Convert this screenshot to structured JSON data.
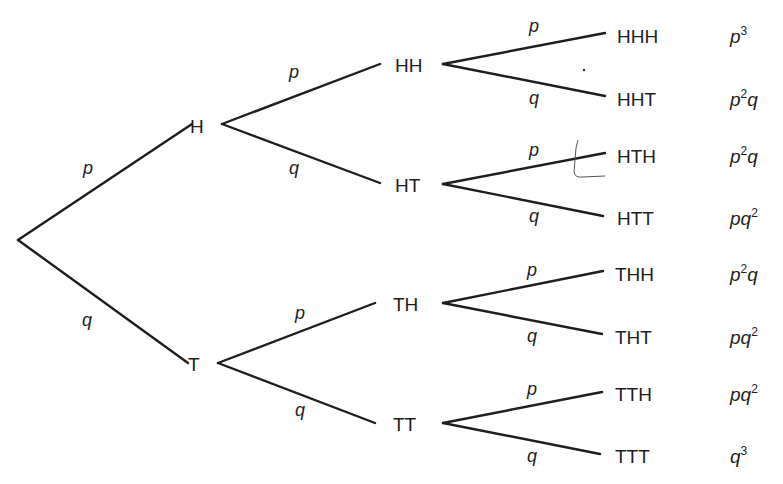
{
  "diagram": {
    "type": "probability-tree",
    "root": {
      "x": 18,
      "y": 240
    },
    "level1": [
      {
        "id": "H",
        "label": "H",
        "x": 190,
        "y": 126,
        "branch_start": [
          222,
          124
        ],
        "edge_label": "p",
        "edge_label_pos": [
          88,
          168
        ]
      },
      {
        "id": "T",
        "label": "T",
        "x": 188,
        "y": 364,
        "branch_start": [
          218,
          363
        ],
        "edge_label": "q",
        "edge_label_pos": [
          87,
          320
        ]
      }
    ],
    "level2": [
      {
        "id": "HH",
        "label": "HH",
        "parent": "H",
        "x": 395,
        "y": 65,
        "end": [
          380,
          64
        ],
        "branch_start": [
          443,
          64
        ],
        "edge_label": "p",
        "edge_label_pos": [
          294,
          72
        ]
      },
      {
        "id": "HT",
        "label": "HT",
        "parent": "H",
        "x": 395,
        "y": 185,
        "end": [
          380,
          183
        ],
        "branch_start": [
          443,
          184
        ],
        "edge_label": "q",
        "edge_label_pos": [
          294,
          168
        ]
      },
      {
        "id": "TH",
        "label": "TH",
        "parent": "T",
        "x": 393,
        "y": 304,
        "end": [
          375,
          303
        ],
        "branch_start": [
          443,
          303
        ],
        "edge_label": "p",
        "edge_label_pos": [
          300,
          313
        ]
      },
      {
        "id": "TT",
        "label": "TT",
        "parent": "T",
        "x": 393,
        "y": 424,
        "end": [
          375,
          423
        ],
        "branch_start": [
          443,
          423
        ],
        "edge_label": "q",
        "edge_label_pos": [
          300,
          410
        ]
      }
    ],
    "level3": [
      {
        "id": "HHH",
        "label": "HHH",
        "parent": "HH",
        "x": 617,
        "y": 36,
        "end": [
          605,
          33
        ],
        "edge_label": "p",
        "edge_label_pos": [
          534,
          26
        ],
        "probability": {
          "base": "p",
          "exp": "3",
          "tail": ""
        }
      },
      {
        "id": "HHT",
        "label": "HHT",
        "parent": "HH",
        "x": 617,
        "y": 99,
        "end": [
          605,
          96
        ],
        "edge_label": "q",
        "edge_label_pos": [
          534,
          98
        ],
        "probability": {
          "base": "p",
          "exp": "2",
          "tail": "q"
        }
      },
      {
        "id": "HTH",
        "label": "HTH",
        "parent": "HT",
        "x": 617,
        "y": 156,
        "end": [
          605,
          153
        ],
        "edge_label": "p",
        "edge_label_pos": [
          534,
          150
        ],
        "probability": {
          "base": "p",
          "exp": "2",
          "tail": "q"
        }
      },
      {
        "id": "HTT",
        "label": "HTT",
        "parent": "HT",
        "x": 617,
        "y": 218,
        "end": [
          603,
          216
        ],
        "edge_label": "q",
        "edge_label_pos": [
          534,
          216
        ],
        "probability": {
          "base": "pq",
          "exp": "2",
          "tail": ""
        }
      },
      {
        "id": "THH",
        "label": "THH",
        "parent": "TH",
        "x": 615,
        "y": 274,
        "end": [
          603,
          271
        ],
        "edge_label": "p",
        "edge_label_pos": [
          532,
          270
        ],
        "probability": {
          "base": "p",
          "exp": "2",
          "tail": "q"
        }
      },
      {
        "id": "THT",
        "label": "THT",
        "parent": "TH",
        "x": 615,
        "y": 337,
        "end": [
          602,
          334
        ],
        "edge_label": "q",
        "edge_label_pos": [
          532,
          336
        ],
        "probability": {
          "base": "pq",
          "exp": "2",
          "tail": ""
        }
      },
      {
        "id": "TTH",
        "label": "TTH",
        "parent": "TT",
        "x": 615,
        "y": 394,
        "end": [
          602,
          392
        ],
        "edge_label": "p",
        "edge_label_pos": [
          532,
          389
        ],
        "probability": {
          "base": "pq",
          "exp": "2",
          "tail": ""
        }
      },
      {
        "id": "TTT",
        "label": "TTT",
        "parent": "TT",
        "x": 615,
        "y": 456,
        "end": [
          600,
          454
        ],
        "edge_label": "q",
        "edge_label_pos": [
          532,
          456
        ],
        "probability": {
          "base": "q",
          "exp": "3",
          "tail": ""
        }
      }
    ],
    "probability_column_x": 730,
    "line_color": "#1e1e1e"
  }
}
